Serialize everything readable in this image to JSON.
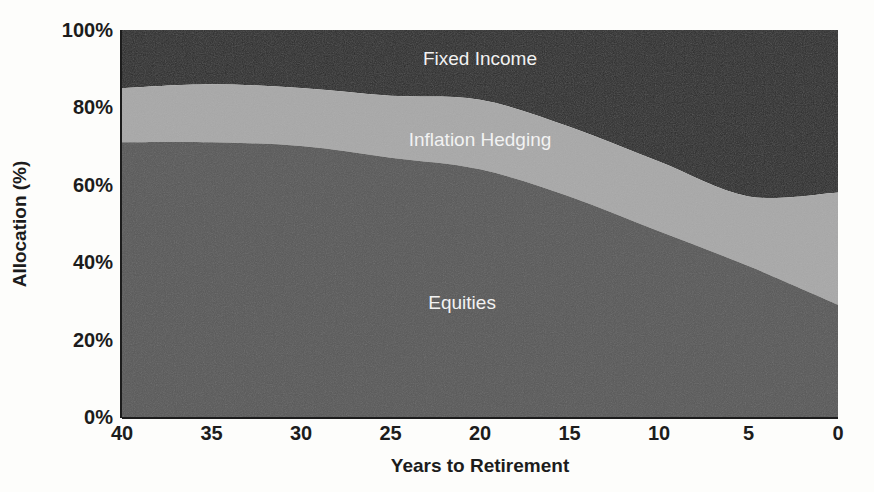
{
  "chart_data": {
    "type": "area",
    "title": "",
    "subtitle": "",
    "xlabel": "Years to Retirement",
    "ylabel": "Allocation (%)",
    "stacked": true,
    "grid": false,
    "legend_position": "inline-labels",
    "xlim": [
      40,
      0
    ],
    "ylim": [
      0,
      100
    ],
    "x_axis_reversed": true,
    "x": [
      40,
      35,
      30,
      25,
      20,
      15,
      10,
      5,
      0
    ],
    "xticks": [
      "40",
      "35",
      "30",
      "25",
      "20",
      "15",
      "10",
      "5",
      "0"
    ],
    "yticks": [
      "0%",
      "20%",
      "40%",
      "60%",
      "80%",
      "100%"
    ],
    "ytick_values": [
      0,
      20,
      40,
      60,
      80,
      100
    ],
    "series": [
      {
        "name": "Equities",
        "color": "#585858",
        "label_color": "#f2f2f2",
        "values": [
          71,
          71,
          70,
          67,
          64,
          57,
          48,
          39,
          29
        ]
      },
      {
        "name": "Inflation Hedging",
        "color": "#a8a8a8",
        "label_color": "#f7f7f7",
        "values": [
          14,
          15,
          15,
          16,
          18,
          18,
          18,
          18,
          29
        ]
      },
      {
        "name": "Fixed Income",
        "color": "#2b2b2b",
        "label_color": "#f2f2f2",
        "values": [
          15,
          14,
          15,
          17,
          18,
          25,
          34,
          43,
          42
        ]
      }
    ],
    "cumulative_tops": {
      "equities": [
        71,
        71,
        70,
        67,
        64,
        57,
        48,
        39,
        29
      ],
      "inflation_hedging": [
        85,
        86,
        85,
        83,
        82,
        75,
        66,
        57,
        58
      ],
      "fixed_income": [
        100,
        100,
        100,
        100,
        100,
        100,
        100,
        100,
        100
      ]
    },
    "annotations": [
      {
        "text": "Fixed Income",
        "x_years": 20,
        "y_pct": 91
      },
      {
        "text": "Inflation Hedging",
        "x_years": 20,
        "y_pct": 70
      },
      {
        "text": "Equities",
        "x_years": 21,
        "y_pct": 28
      }
    ],
    "colors": {
      "equities": "#585858",
      "inflation_hedging": "#a8a8a8",
      "fixed_income": "#2b2b2b",
      "background": "#fdfdfb",
      "axis": "#1c1c1c"
    }
  }
}
